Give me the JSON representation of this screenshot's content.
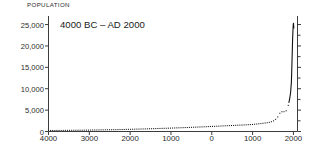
{
  "chart_data": {
    "type": "line",
    "title": "",
    "annotation": "4000 BC – AD 2000",
    "ylabel": "POPULATION",
    "xlabel": "",
    "ylim": [
      0,
      27000
    ],
    "xlim": [
      -4000,
      2100
    ],
    "grid": false,
    "legend": null,
    "y_ticks": [
      0,
      5000,
      10000,
      15000,
      20000,
      25000
    ],
    "y_tick_labels": [
      "0",
      "5,000",
      "10,000",
      "15,000",
      "20,000",
      "25,000"
    ],
    "x_ticks": [
      -4000,
      -3000,
      -2000,
      -1000,
      0,
      1000,
      2000
    ],
    "x_tick_labels": [
      "4000",
      "3000",
      "2000",
      "1000",
      "0",
      "1000",
      "2000"
    ],
    "series": [
      {
        "name": "World population",
        "style": "dotted-to-solid",
        "x": [
          -4000,
          -3800,
          -3600,
          -3400,
          -3200,
          -3000,
          -2800,
          -2600,
          -2400,
          -2200,
          -2000,
          -1800,
          -1600,
          -1400,
          -1200,
          -1000,
          -800,
          -600,
          -400,
          -200,
          0,
          200,
          400,
          600,
          800,
          1000,
          1100,
          1200,
          1300,
          1400,
          1500,
          1600,
          1650,
          1700,
          1750,
          1800,
          1850,
          1900,
          1930,
          1950,
          1960,
          1970,
          1980,
          1990,
          2000,
          2010
        ],
        "y": [
          230,
          250,
          270,
          290,
          310,
          340,
          370,
          400,
          430,
          470,
          520,
          570,
          620,
          680,
          740,
          800,
          870,
          940,
          1020,
          1100,
          1190,
          1280,
          1370,
          1460,
          1550,
          1650,
          1750,
          1860,
          1980,
          2120,
          2400,
          3100,
          4100,
          4600,
          4650,
          4600,
          5200,
          7200,
          9000,
          11500,
          14500,
          18000,
          21500,
          24000,
          25500,
          24200
        ]
      }
    ]
  },
  "figure": {
    "background_color": "#ffffff",
    "line_color": "#111111",
    "axis_color": "#3c3c3c",
    "text_color": "#2b2b2b"
  }
}
